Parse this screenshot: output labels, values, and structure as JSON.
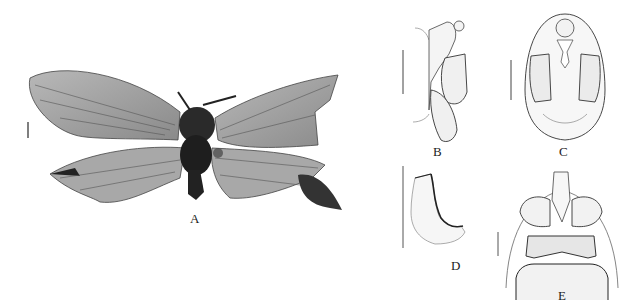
{
  "figure": {
    "panels": [
      {
        "id": "A",
        "label": "A",
        "description": "Habitus photograph, dorsal view (specimen with spread wings)"
      },
      {
        "id": "B",
        "label": "B",
        "description": "Genitalia, lateral view (line drawing)"
      },
      {
        "id": "C",
        "label": "C",
        "description": "Genitalia, dorsal/ventral view (line drawing)"
      },
      {
        "id": "D",
        "label": "D",
        "description": "Genitalic sclerite, lateral view (line drawing)"
      },
      {
        "id": "E",
        "label": "E",
        "description": "Terminal abdominal segments, ventral view (line drawing)"
      }
    ],
    "scale_bars": [
      "A",
      "B",
      "C",
      "D",
      "E"
    ]
  }
}
